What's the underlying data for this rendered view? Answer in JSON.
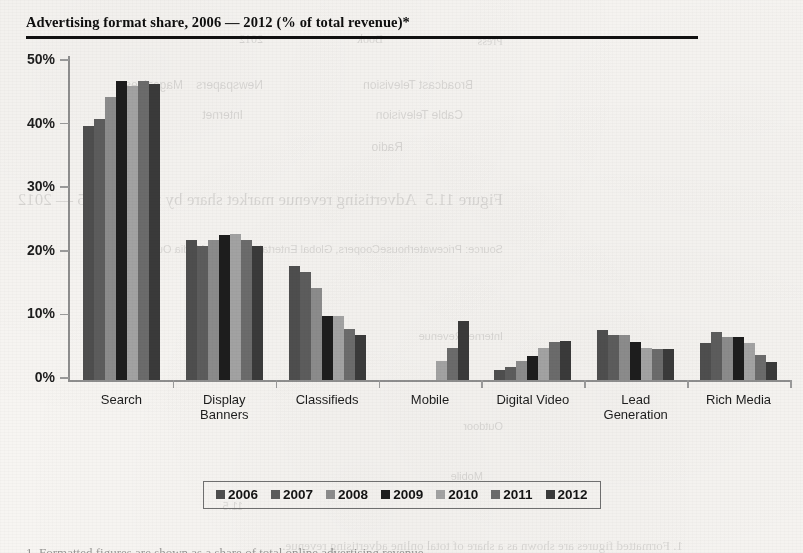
{
  "page": {
    "title": "Advertising format share, 2006 — 2012 (% of total revenue)*",
    "bleed_through_note": "mirrored faint text from reverse page",
    "bleed_fragments": [
      "Broadcast Television",
      "Cable Television",
      "Radio",
      "Newspapers",
      "Magazines",
      "Internet",
      "Outdoor",
      "Figure 11.5  Advertising revenue market share by media, 2005 — 2012",
      "Source: PricewaterhouseCoopers"
    ],
    "footer_partial": "1. Formatted figures are shown as a share of total online advertising revenue."
  },
  "chart_data": {
    "type": "bar",
    "title": "Advertising format share, 2006 — 2012 (% of total revenue)*",
    "xlabel": "",
    "ylabel": "",
    "ylim": [
      0,
      50
    ],
    "ytick_labels": [
      "0%",
      "10%",
      "20%",
      "30%",
      "40%",
      "50%"
    ],
    "ytick_values": [
      0,
      10,
      20,
      30,
      40,
      50
    ],
    "grid": false,
    "legend_position": "bottom",
    "categories": [
      "Search",
      "Display Banners",
      "Classifieds",
      "Mobile",
      "Digital Video",
      "Lead Generation",
      "Rich Media"
    ],
    "category_label_lines": [
      [
        "Search"
      ],
      [
        "Display",
        "Banners"
      ],
      [
        "Classifieds"
      ],
      [
        "Mobile"
      ],
      [
        "Digital Video"
      ],
      [
        "Lead",
        "Generation"
      ],
      [
        "Rich Media"
      ]
    ],
    "series": [
      {
        "name": "2006",
        "color": "#4e4e4e",
        "values": [
          40.0,
          22.0,
          18.0,
          0.0,
          1.5,
          7.8,
          5.8
        ]
      },
      {
        "name": "2007",
        "color": "#5c5c5c",
        "values": [
          41.0,
          21.0,
          17.0,
          0.0,
          2.0,
          7.0,
          7.5
        ]
      },
      {
        "name": "2008",
        "color": "#8b8b8b",
        "values": [
          44.5,
          22.0,
          14.5,
          0.0,
          3.0,
          7.0,
          6.8
        ]
      },
      {
        "name": "2009",
        "color": "#1d1d1d",
        "values": [
          47.0,
          22.8,
          10.0,
          0.0,
          3.8,
          6.0,
          6.8
        ]
      },
      {
        "name": "2010",
        "color": "#a2a2a2",
        "values": [
          46.2,
          23.0,
          10.0,
          3.0,
          5.0,
          5.0,
          5.8
        ]
      },
      {
        "name": "2011",
        "color": "#6b6b6b",
        "values": [
          47.0,
          22.0,
          8.0,
          5.0,
          6.0,
          4.8,
          4.0
        ]
      },
      {
        "name": "2012",
        "color": "#3a3a3a",
        "values": [
          46.5,
          21.0,
          7.0,
          9.3,
          6.2,
          4.8,
          2.8
        ]
      }
    ]
  }
}
